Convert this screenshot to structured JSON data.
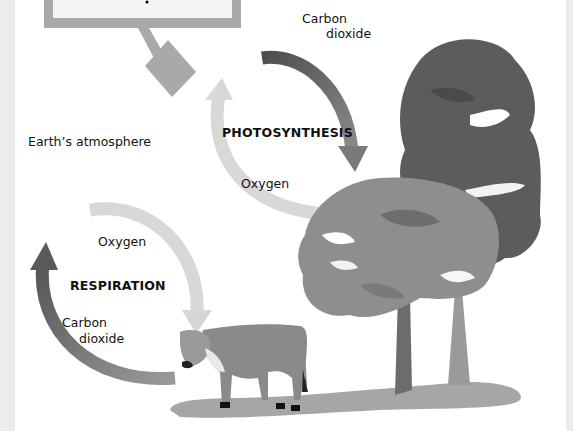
{
  "diagram": {
    "atmosphere_label": "Earth’s atmosphere",
    "callout": {
      "visible_text": "."
    },
    "photosynthesis": {
      "title": "PHOTOSYNTHESIS",
      "input_label_line1": "Carbon",
      "input_label_line2": "dioxide",
      "output_label": "Oxygen"
    },
    "respiration": {
      "title": "RESPIRATION",
      "input_label": "Oxygen",
      "output_label_line1": "Carbon",
      "output_label_line2": "dioxide"
    },
    "illustrations": [
      "trees",
      "cow"
    ],
    "colors": {
      "dark_arrow": "#6e6e6e",
      "light_arrow": "#d6d6d6",
      "callout_border": "#a9a9a9",
      "tree_dark": "#5a5a5a",
      "tree_light": "#8d8d8d",
      "cow": "#8a8a8a",
      "shadow": "#a6a6a6"
    }
  }
}
